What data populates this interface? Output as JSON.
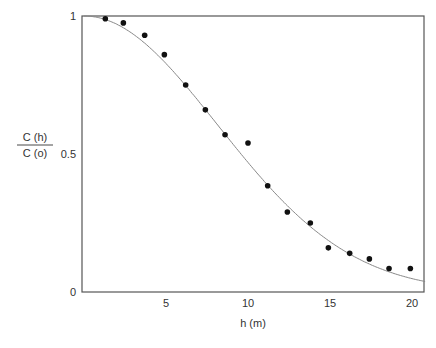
{
  "chart_data": {
    "type": "scatter",
    "title": "",
    "xlabel": "h (m)",
    "ylabel": {
      "numerator": "C (h)",
      "denominator": "C (o)"
    },
    "xlim": [
      0,
      21
    ],
    "ylim": [
      0,
      1
    ],
    "x_ticks": [
      5,
      10,
      15,
      20
    ],
    "y_ticks": [
      {
        "value": 0,
        "label": "0"
      },
      {
        "value": 0.5,
        "label": "0.5"
      },
      {
        "value": 1,
        "label": "1"
      }
    ],
    "grid": false,
    "legend": null,
    "series": [
      {
        "name": "measured",
        "kind": "scatter",
        "color": "#111111",
        "x": [
          1.3,
          2.4,
          3.7,
          4.9,
          6.2,
          7.4,
          8.6,
          10.0,
          11.2,
          12.4,
          13.8,
          14.9,
          16.2,
          17.4,
          18.6,
          19.9
        ],
        "y": [
          0.99,
          0.975,
          0.93,
          0.86,
          0.75,
          0.66,
          0.57,
          0.54,
          0.385,
          0.29,
          0.25,
          0.16,
          0.14,
          0.12,
          0.085,
          0.085
        ]
      },
      {
        "name": "fitted curve",
        "kind": "line",
        "color": "#888888",
        "model": "exp(-(h/11.5)^2)",
        "x": [
          0,
          2,
          4,
          6,
          8,
          10,
          12,
          14,
          16,
          18,
          20,
          21
        ],
        "y": [
          1.0,
          0.97,
          0.886,
          0.762,
          0.616,
          0.47,
          0.337,
          0.227,
          0.144,
          0.086,
          0.048,
          0.036
        ]
      }
    ]
  }
}
